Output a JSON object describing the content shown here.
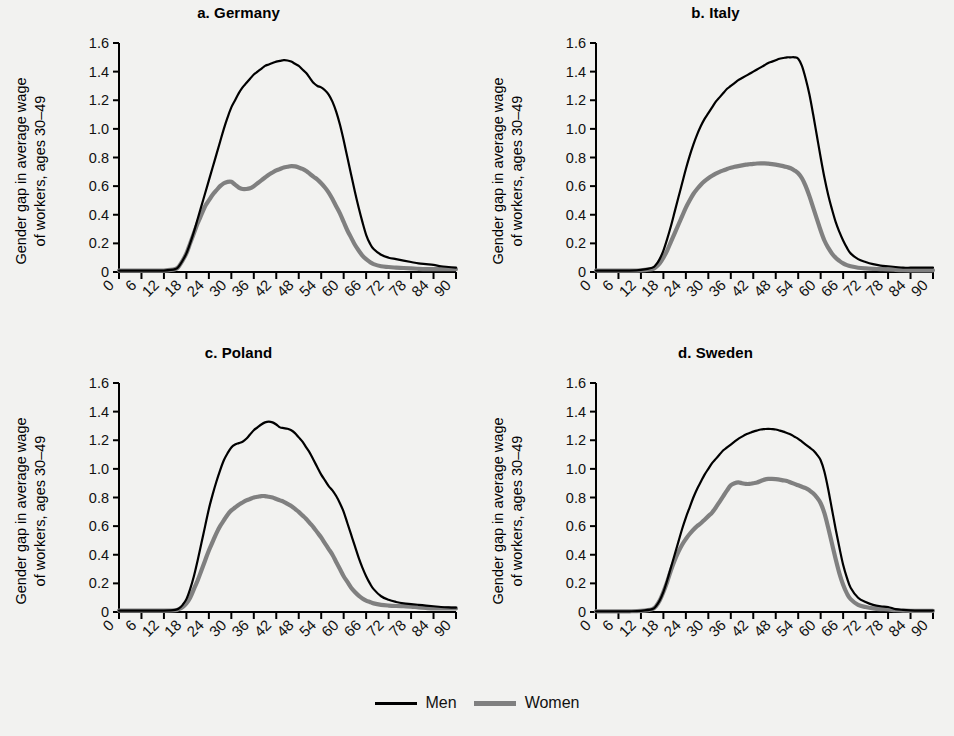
{
  "figure": {
    "background": "#f2f2f0",
    "ylabel_line1": "Gender gap in average wage",
    "ylabel_line2": "of workers, ages 30–49"
  },
  "legend": {
    "position": "bottom-center",
    "entries": [
      {
        "label": "Men",
        "color": "#000000",
        "name": "men"
      },
      {
        "label": "Women",
        "color": "#808080",
        "name": "women"
      }
    ]
  },
  "chart_data": [
    {
      "type": "line",
      "panel": "a",
      "title": "a. Germany",
      "xlabel": "",
      "ylabel": "Gender gap in average wage of workers, ages 30–49",
      "xlim": [
        0,
        90
      ],
      "ylim": [
        0,
        1.6
      ],
      "xticks": [
        0,
        6,
        12,
        18,
        24,
        30,
        36,
        42,
        48,
        54,
        60,
        66,
        72,
        78,
        84,
        90
      ],
      "xtick_labels": [
        "0",
        "6",
        "12",
        "18",
        "24",
        "30",
        "36",
        "42",
        "48",
        "54",
        "60",
        "66",
        "72",
        "78",
        "84",
        "90"
      ],
      "yticks": [
        0,
        0.2,
        0.4,
        0.6,
        0.8,
        1.0,
        1.2,
        1.4,
        1.6
      ],
      "ytick_labels": [
        "0",
        "0.2",
        "0.4",
        "0.6",
        "0.8",
        "1.0",
        "1.2",
        "1.4",
        "1.6"
      ],
      "grid": false,
      "x": [
        0,
        3,
        6,
        9,
        12,
        15,
        16,
        17,
        18,
        19,
        20,
        21,
        22,
        23,
        24,
        25,
        26,
        27,
        28,
        29,
        30,
        31,
        32,
        33,
        34,
        35,
        36,
        37,
        38,
        39,
        40,
        41,
        42,
        43,
        44,
        45,
        46,
        47,
        48,
        49,
        50,
        51,
        52,
        53,
        54,
        55,
        56,
        57,
        58,
        59,
        60,
        61,
        62,
        63,
        64,
        65,
        66,
        67,
        68,
        70,
        72,
        74,
        76,
        78,
        80,
        82,
        84,
        86,
        88,
        90
      ],
      "series": [
        {
          "name": "Men",
          "color": "#000000",
          "values": [
            0.01,
            0.01,
            0.01,
            0.01,
            0.01,
            0.02,
            0.04,
            0.08,
            0.13,
            0.2,
            0.28,
            0.37,
            0.46,
            0.55,
            0.64,
            0.73,
            0.82,
            0.91,
            1.0,
            1.08,
            1.15,
            1.2,
            1.25,
            1.29,
            1.32,
            1.35,
            1.38,
            1.4,
            1.42,
            1.44,
            1.45,
            1.46,
            1.47,
            1.475,
            1.48,
            1.478,
            1.47,
            1.455,
            1.44,
            1.415,
            1.39,
            1.355,
            1.32,
            1.3,
            1.29,
            1.27,
            1.24,
            1.19,
            1.12,
            1.03,
            0.92,
            0.8,
            0.68,
            0.56,
            0.45,
            0.35,
            0.26,
            0.2,
            0.16,
            0.12,
            0.1,
            0.09,
            0.08,
            0.07,
            0.06,
            0.055,
            0.05,
            0.04,
            0.035,
            0.03
          ]
        },
        {
          "name": "Women",
          "color": "#808080",
          "values": [
            0.01,
            0.01,
            0.01,
            0.01,
            0.01,
            0.02,
            0.04,
            0.08,
            0.13,
            0.2,
            0.27,
            0.34,
            0.4,
            0.46,
            0.5,
            0.54,
            0.57,
            0.6,
            0.62,
            0.63,
            0.63,
            0.61,
            0.59,
            0.58,
            0.58,
            0.585,
            0.6,
            0.62,
            0.64,
            0.66,
            0.68,
            0.695,
            0.71,
            0.72,
            0.73,
            0.735,
            0.74,
            0.738,
            0.73,
            0.72,
            0.705,
            0.685,
            0.665,
            0.645,
            0.62,
            0.59,
            0.555,
            0.51,
            0.46,
            0.41,
            0.35,
            0.29,
            0.24,
            0.19,
            0.15,
            0.115,
            0.09,
            0.07,
            0.055,
            0.04,
            0.035,
            0.03,
            0.028,
            0.025,
            0.022,
            0.02,
            0.02,
            0.02,
            0.02,
            0.02
          ]
        }
      ]
    },
    {
      "type": "line",
      "panel": "b",
      "title": "b. Italy",
      "xlabel": "",
      "ylabel": "Gender gap in average wage of workers, ages 30–49",
      "xlim": [
        0,
        90
      ],
      "ylim": [
        0,
        1.6
      ],
      "xticks": [
        0,
        6,
        12,
        18,
        24,
        30,
        36,
        42,
        48,
        54,
        60,
        66,
        72,
        78,
        84,
        90
      ],
      "xtick_labels": [
        "0",
        "6",
        "12",
        "18",
        "24",
        "30",
        "36",
        "42",
        "48",
        "54",
        "60",
        "66",
        "72",
        "78",
        "84",
        "90"
      ],
      "yticks": [
        0,
        0.2,
        0.4,
        0.6,
        0.8,
        1.0,
        1.2,
        1.4,
        1.6
      ],
      "ytick_labels": [
        "0",
        "0.2",
        "0.4",
        "0.6",
        "0.8",
        "1.0",
        "1.2",
        "1.4",
        "1.6"
      ],
      "grid": false,
      "x": [
        0,
        3,
        6,
        9,
        12,
        15,
        16,
        17,
        18,
        19,
        20,
        21,
        22,
        23,
        24,
        25,
        26,
        27,
        28,
        29,
        30,
        31,
        32,
        33,
        34,
        35,
        36,
        37,
        38,
        39,
        40,
        41,
        42,
        43,
        44,
        45,
        46,
        47,
        48,
        49,
        50,
        51,
        52,
        53,
        54,
        55,
        56,
        57,
        58,
        59,
        60,
        61,
        62,
        63,
        64,
        65,
        66,
        67,
        68,
        70,
        72,
        74,
        76,
        78,
        80,
        82,
        84,
        86,
        88,
        90
      ],
      "series": [
        {
          "name": "Men",
          "color": "#000000",
          "values": [
            0.01,
            0.01,
            0.01,
            0.01,
            0.015,
            0.03,
            0.05,
            0.09,
            0.15,
            0.23,
            0.32,
            0.42,
            0.52,
            0.62,
            0.72,
            0.81,
            0.89,
            0.96,
            1.02,
            1.07,
            1.11,
            1.15,
            1.19,
            1.22,
            1.25,
            1.28,
            1.3,
            1.32,
            1.34,
            1.355,
            1.37,
            1.385,
            1.4,
            1.415,
            1.43,
            1.445,
            1.46,
            1.47,
            1.48,
            1.49,
            1.495,
            1.5,
            1.5,
            1.5,
            1.49,
            1.44,
            1.35,
            1.24,
            1.1,
            0.95,
            0.8,
            0.66,
            0.54,
            0.44,
            0.35,
            0.28,
            0.22,
            0.17,
            0.13,
            0.09,
            0.07,
            0.055,
            0.045,
            0.04,
            0.035,
            0.03,
            0.03,
            0.03,
            0.03,
            0.03
          ]
        },
        {
          "name": "Women",
          "color": "#808080",
          "values": [
            0.01,
            0.01,
            0.01,
            0.01,
            0.012,
            0.02,
            0.035,
            0.06,
            0.1,
            0.15,
            0.21,
            0.27,
            0.33,
            0.39,
            0.45,
            0.5,
            0.545,
            0.58,
            0.61,
            0.635,
            0.655,
            0.672,
            0.687,
            0.7,
            0.71,
            0.72,
            0.728,
            0.735,
            0.74,
            0.745,
            0.75,
            0.753,
            0.756,
            0.758,
            0.759,
            0.759,
            0.757,
            0.754,
            0.75,
            0.745,
            0.74,
            0.733,
            0.725,
            0.71,
            0.69,
            0.655,
            0.6,
            0.53,
            0.45,
            0.37,
            0.29,
            0.22,
            0.17,
            0.13,
            0.1,
            0.078,
            0.06,
            0.048,
            0.04,
            0.03,
            0.025,
            0.022,
            0.02,
            0.018,
            0.015,
            0.013,
            0.012,
            0.012,
            0.012,
            0.012
          ]
        }
      ]
    },
    {
      "type": "line",
      "panel": "c",
      "title": "c. Poland",
      "xlabel": "",
      "ylabel": "Gender gap in average wage of workers, ages 30–49",
      "xlim": [
        0,
        90
      ],
      "ylim": [
        0,
        1.6
      ],
      "xticks": [
        0,
        6,
        12,
        18,
        24,
        30,
        36,
        42,
        48,
        54,
        60,
        66,
        72,
        78,
        84,
        90
      ],
      "xtick_labels": [
        "0",
        "6",
        "12",
        "18",
        "24",
        "30",
        "36",
        "42",
        "48",
        "54",
        "60",
        "66",
        "72",
        "78",
        "84",
        "90"
      ],
      "yticks": [
        0,
        0.2,
        0.4,
        0.6,
        0.8,
        1.0,
        1.2,
        1.4,
        1.6
      ],
      "ytick_labels": [
        "0",
        "0.2",
        "0.4",
        "0.6",
        "0.8",
        "1.0",
        "1.2",
        "1.4",
        "1.6"
      ],
      "grid": false,
      "x": [
        0,
        3,
        6,
        9,
        12,
        15,
        16,
        17,
        18,
        19,
        20,
        21,
        22,
        23,
        24,
        25,
        26,
        27,
        28,
        29,
        30,
        31,
        32,
        33,
        34,
        35,
        36,
        37,
        38,
        39,
        40,
        41,
        42,
        43,
        44,
        45,
        46,
        47,
        48,
        49,
        50,
        51,
        52,
        53,
        54,
        55,
        56,
        57,
        58,
        59,
        60,
        61,
        62,
        63,
        64,
        65,
        66,
        67,
        68,
        70,
        72,
        74,
        76,
        78,
        80,
        82,
        84,
        86,
        88,
        90
      ],
      "series": [
        {
          "name": "Men",
          "color": "#000000",
          "values": [
            0.01,
            0.01,
            0.01,
            0.01,
            0.01,
            0.015,
            0.025,
            0.05,
            0.09,
            0.16,
            0.25,
            0.36,
            0.48,
            0.6,
            0.72,
            0.82,
            0.91,
            0.99,
            1.06,
            1.11,
            1.15,
            1.17,
            1.18,
            1.19,
            1.21,
            1.24,
            1.27,
            1.29,
            1.31,
            1.325,
            1.33,
            1.325,
            1.31,
            1.29,
            1.285,
            1.28,
            1.27,
            1.25,
            1.22,
            1.19,
            1.15,
            1.11,
            1.06,
            1.01,
            0.96,
            0.92,
            0.88,
            0.85,
            0.81,
            0.76,
            0.7,
            0.62,
            0.54,
            0.46,
            0.38,
            0.31,
            0.25,
            0.2,
            0.16,
            0.11,
            0.085,
            0.07,
            0.06,
            0.055,
            0.05,
            0.045,
            0.04,
            0.035,
            0.032,
            0.03
          ]
        },
        {
          "name": "Women",
          "color": "#808080",
          "values": [
            0.01,
            0.01,
            0.01,
            0.01,
            0.01,
            0.012,
            0.02,
            0.035,
            0.06,
            0.1,
            0.16,
            0.22,
            0.29,
            0.36,
            0.43,
            0.49,
            0.55,
            0.6,
            0.64,
            0.68,
            0.71,
            0.73,
            0.75,
            0.765,
            0.78,
            0.79,
            0.8,
            0.805,
            0.81,
            0.81,
            0.805,
            0.8,
            0.79,
            0.78,
            0.77,
            0.755,
            0.74,
            0.72,
            0.7,
            0.675,
            0.65,
            0.62,
            0.59,
            0.555,
            0.52,
            0.48,
            0.44,
            0.4,
            0.35,
            0.3,
            0.25,
            0.21,
            0.17,
            0.14,
            0.115,
            0.095,
            0.08,
            0.07,
            0.06,
            0.05,
            0.045,
            0.042,
            0.04,
            0.038,
            0.032,
            0.028,
            0.025,
            0.025,
            0.025,
            0.025
          ]
        }
      ]
    },
    {
      "type": "line",
      "panel": "d",
      "title": "d. Sweden",
      "xlabel": "",
      "ylabel": "Gender gap in average wage of workers, ages 30–49",
      "xlim": [
        0,
        90
      ],
      "ylim": [
        0,
        1.6
      ],
      "xticks": [
        0,
        6,
        12,
        18,
        24,
        30,
        36,
        42,
        48,
        54,
        60,
        66,
        72,
        78,
        84,
        90
      ],
      "xtick_labels": [
        "0",
        "6",
        "12",
        "18",
        "24",
        "30",
        "36",
        "42",
        "48",
        "54",
        "60",
        "66",
        "72",
        "78",
        "84",
        "90"
      ],
      "yticks": [
        0,
        0.2,
        0.4,
        0.6,
        0.8,
        1.0,
        1.2,
        1.4,
        1.6
      ],
      "ytick_labels": [
        "0",
        "0.2",
        "0.4",
        "0.6",
        "0.8",
        "1.0",
        "1.2",
        "1.4",
        "1.6"
      ],
      "grid": false,
      "x": [
        0,
        3,
        6,
        9,
        12,
        15,
        16,
        17,
        18,
        19,
        20,
        21,
        22,
        23,
        24,
        25,
        26,
        27,
        28,
        29,
        30,
        31,
        32,
        33,
        34,
        35,
        36,
        37,
        38,
        39,
        40,
        41,
        42,
        43,
        44,
        45,
        46,
        47,
        48,
        49,
        50,
        51,
        52,
        53,
        54,
        55,
        56,
        57,
        58,
        59,
        60,
        61,
        62,
        63,
        64,
        65,
        66,
        67,
        68,
        70,
        72,
        74,
        76,
        78,
        80,
        82,
        84,
        86,
        88,
        90
      ],
      "series": [
        {
          "name": "Men",
          "color": "#000000",
          "values": [
            0.005,
            0.005,
            0.005,
            0.005,
            0.008,
            0.02,
            0.04,
            0.08,
            0.14,
            0.22,
            0.31,
            0.4,
            0.49,
            0.58,
            0.66,
            0.73,
            0.8,
            0.86,
            0.91,
            0.96,
            1.0,
            1.04,
            1.07,
            1.1,
            1.13,
            1.15,
            1.17,
            1.19,
            1.21,
            1.225,
            1.24,
            1.25,
            1.26,
            1.268,
            1.275,
            1.278,
            1.28,
            1.278,
            1.275,
            1.268,
            1.26,
            1.25,
            1.24,
            1.225,
            1.21,
            1.19,
            1.17,
            1.15,
            1.13,
            1.1,
            1.06,
            0.98,
            0.86,
            0.72,
            0.58,
            0.45,
            0.33,
            0.24,
            0.17,
            0.1,
            0.07,
            0.05,
            0.04,
            0.035,
            0.02,
            0.015,
            0.012,
            0.01,
            0.01,
            0.01
          ]
        },
        {
          "name": "Women",
          "color": "#808080",
          "values": [
            0.005,
            0.005,
            0.005,
            0.005,
            0.008,
            0.02,
            0.04,
            0.08,
            0.14,
            0.21,
            0.29,
            0.36,
            0.42,
            0.47,
            0.51,
            0.545,
            0.575,
            0.6,
            0.62,
            0.645,
            0.67,
            0.695,
            0.73,
            0.77,
            0.81,
            0.85,
            0.885,
            0.9,
            0.905,
            0.9,
            0.895,
            0.895,
            0.9,
            0.905,
            0.915,
            0.925,
            0.93,
            0.93,
            0.928,
            0.925,
            0.92,
            0.915,
            0.905,
            0.895,
            0.885,
            0.875,
            0.865,
            0.85,
            0.83,
            0.8,
            0.76,
            0.69,
            0.59,
            0.48,
            0.37,
            0.27,
            0.19,
            0.13,
            0.09,
            0.05,
            0.035,
            0.025,
            0.02,
            0.018,
            0.012,
            0.01,
            0.008,
            0.008,
            0.008,
            0.008
          ]
        }
      ]
    }
  ]
}
